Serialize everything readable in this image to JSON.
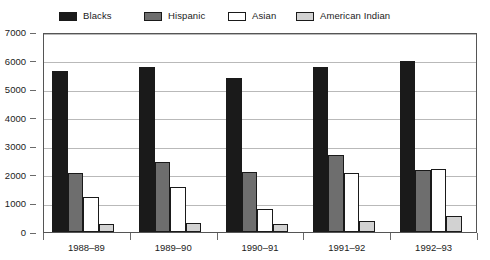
{
  "chart_data": {
    "type": "bar",
    "title": "",
    "subtitle": "",
    "xlabel": "",
    "ylabel": "",
    "categories": [
      "1988–89",
      "1989–90",
      "1990–91",
      "1991–92",
      "1992–93"
    ],
    "series": [
      {
        "name": "Blacks",
        "color": "#1a1a1a",
        "values": [
          5650,
          5790,
          5400,
          5790,
          6000
        ]
      },
      {
        "name": "Hispanic",
        "color": "#6e6e6e",
        "values": [
          2050,
          2450,
          2100,
          2700,
          2180
        ]
      },
      {
        "name": "Asian",
        "color": "#ffffff",
        "values": [
          1230,
          1580,
          800,
          2080,
          2200
        ]
      },
      {
        "name": "American Indian",
        "color": "#d2d2d2",
        "values": [
          270,
          320,
          280,
          370,
          560
        ]
      }
    ],
    "ylim": [
      0,
      7000
    ],
    "ytick_labels": [
      "0",
      "1000",
      "2000",
      "3000",
      "4000",
      "5000",
      "6000",
      "7000"
    ],
    "ytick_values": [
      0,
      1000,
      2000,
      3000,
      4000,
      5000,
      6000,
      7000
    ],
    "grid": true,
    "grid_axis": "y",
    "legend_position": "top",
    "bar_border_color": "#1a1a1a",
    "frame_color": "#555555",
    "gridline_color": "#b9b9b9",
    "background_color": "#ffffff"
  },
  "legend": {
    "items": [
      {
        "label": "Blacks",
        "swatch": "legend-swatch-blacks"
      },
      {
        "label": "Hispanic",
        "swatch": "legend-swatch-hispanic"
      },
      {
        "label": "Asian",
        "swatch": "legend-swatch-asian"
      },
      {
        "label": "American Indian",
        "swatch": "legend-swatch-american-indian"
      }
    ]
  }
}
